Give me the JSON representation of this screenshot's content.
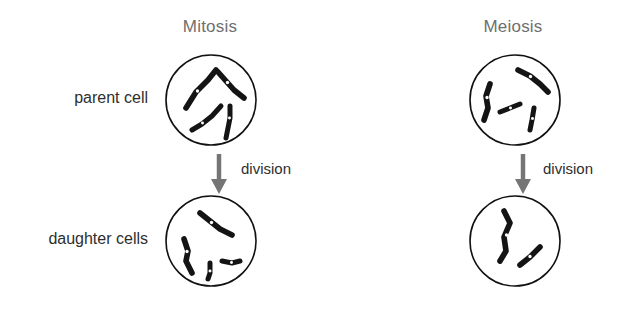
{
  "diagram": {
    "title_row": [
      {
        "key": "mitosis",
        "label": "Mitosis"
      },
      {
        "key": "meiosis",
        "label": "Meiosis"
      }
    ],
    "row_labels": [
      {
        "key": "parent",
        "label": "parent cell"
      },
      {
        "key": "daughter",
        "label": "daughter cells"
      }
    ],
    "process_labels": [
      {
        "key": "mitosis-division",
        "label": "division"
      },
      {
        "key": "meiosis-division",
        "label": "division"
      }
    ],
    "cells": [
      {
        "key": "mitosis-parent",
        "column": "Mitosis",
        "stage": "parent cell",
        "chromosome_count": 4,
        "chromosomes": [
          {
            "path": "M 22 60 L 32 44 L 44 32 L 52 22",
            "centromere": [
              33.5,
              43.0
            ],
            "width": 5.6
          },
          {
            "path": "M 54 24 L 62 33 L 70 42 L 80 50",
            "centromere": [
              63.5,
              34.5
            ],
            "width": 5.6
          },
          {
            "path": "M 28 82 L 38 76 L 48 68 L 57 58",
            "centromere": [
              38.5,
              75.0
            ],
            "width": 5.0
          },
          {
            "path": "M 66 58 L 66 70 L 64 80 L 62 90",
            "centromere": [
              65.5,
              70.0
            ],
            "width": 5.0
          }
        ]
      },
      {
        "key": "mitosis-daughter",
        "column": "Mitosis",
        "stage": "daughter cells",
        "chromosome_count": 4,
        "chromosomes": [
          {
            "path": "M 36 24 L 46 32 L 56 40 L 68 46",
            "centromere": [
              47.5,
              33.5
            ],
            "width": 5.6
          },
          {
            "path": "M 20 50 L 24 62 L 22 72 L 28 84",
            "centromere": [
              23.0,
              62.5
            ],
            "width": 5.6
          },
          {
            "path": "M 46 74 L 46 84 L 44 90",
            "centromere": [
              46.0,
              82.0
            ],
            "width": 5.0
          },
          {
            "path": "M 58 72 L 68 74 L 76 72",
            "centromere": [
              67.5,
              73.5
            ],
            "width": 5.0
          }
        ]
      },
      {
        "key": "meiosis-parent",
        "column": "Meiosis",
        "stage": "parent cell",
        "chromosome_count": 4,
        "chromosomes": [
          {
            "path": "M 22 36 L 18 48 L 20 60 L 16 72",
            "centromere": [
              19.0,
              49.5
            ],
            "width": 5.6
          },
          {
            "path": "M 50 22 L 62 28 L 72 36 L 80 44",
            "centromere": [
              62.5,
              28.5
            ],
            "width": 5.6
          },
          {
            "path": "M 32 64 L 42 60 L 52 56",
            "centromere": [
              42.5,
              60.0
            ],
            "width": 5.0
          },
          {
            "path": "M 66 60 L 64 72 L 62 82",
            "centromere": [
              64.5,
              70.5
            ],
            "width": 5.0
          }
        ]
      },
      {
        "key": "meiosis-daughter",
        "column": "Meiosis",
        "stage": "daughter cells",
        "chromosome_count": 2,
        "chromosomes": [
          {
            "path": "M 36 22 L 42 34 L 36 48 L 38 62 L 32 72",
            "centromere": [
              38.5,
              46.0
            ],
            "width": 5.6
          },
          {
            "path": "M 52 76 L 62 68 L 72 58",
            "centromere": [
              62.0,
              67.5
            ],
            "width": 5.6
          }
        ]
      }
    ],
    "arrows": [
      {
        "key": "mitosis-arrow",
        "direction": "down"
      },
      {
        "key": "meiosis-arrow",
        "direction": "down"
      }
    ],
    "colors": {
      "background": "#ffffff",
      "title_text": "#6f6f6f",
      "label_text": "#2e2e2e",
      "membrane_stroke": "#111111",
      "chromosome": "#141414",
      "centromere": "#ffffff",
      "arrow": "#757575"
    }
  }
}
